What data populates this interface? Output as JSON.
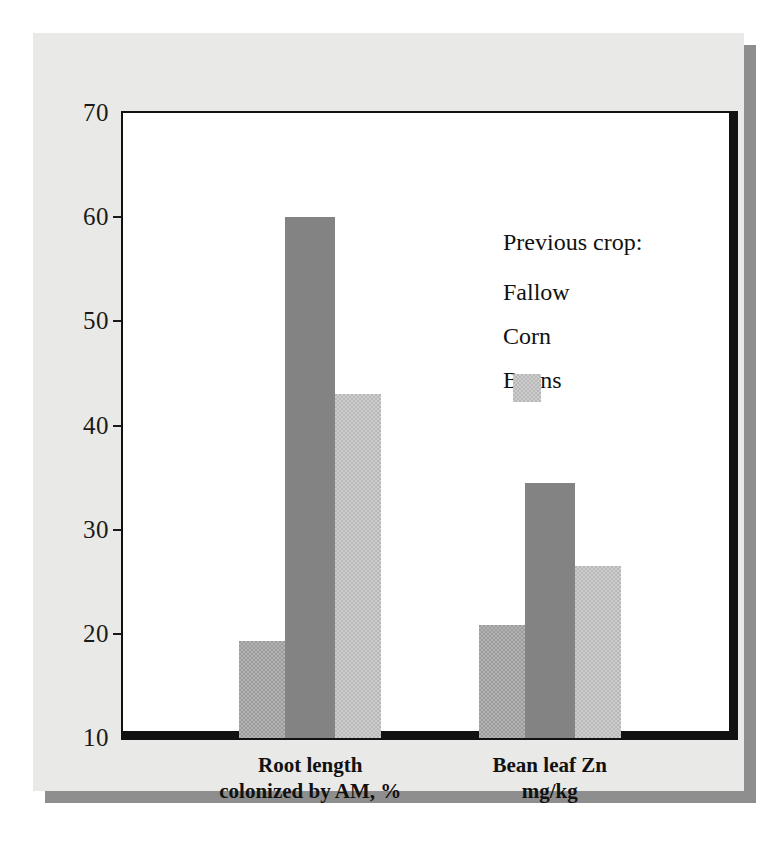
{
  "chart_data": {
    "type": "bar",
    "title": "",
    "xlabel": "",
    "ylabel": "",
    "ylim": [
      10,
      70
    ],
    "yticks": [
      10,
      20,
      30,
      40,
      50,
      60,
      70
    ],
    "ytick_labels": [
      "10",
      "20",
      "30",
      "40",
      "50",
      "60",
      "70"
    ],
    "grid": false,
    "legend_position": "inside-upper-right",
    "legend_title": "Previous crop:",
    "categories": [
      "Root length colonized by AM, %",
      "Bean leaf Zn mg/kg"
    ],
    "category_lines": [
      [
        "Root length",
        "colonized by AM, %"
      ],
      [
        "Bean leaf Zn",
        "mg/kg"
      ]
    ],
    "series": [
      {
        "name": "Fallow",
        "color": "#9c9c9c",
        "values": [
          19.3,
          20.8
        ]
      },
      {
        "name": "Corn",
        "color": "#838383",
        "values": [
          60.0,
          34.5
        ]
      },
      {
        "name": "Beans",
        "color": "#b8b8b8",
        "values": [
          43.0,
          26.5
        ]
      }
    ]
  },
  "legend": {
    "title": "Previous crop:",
    "items": [
      {
        "label": "Fallow"
      },
      {
        "label": "Corn"
      },
      {
        "label": "Beans"
      }
    ]
  },
  "axis": {
    "y_tick_labels": [
      "70",
      "60",
      "50",
      "40",
      "30",
      "20",
      "10"
    ]
  },
  "x_axis": {
    "groups": [
      {
        "line1": "Root length",
        "line2": "colonized by AM, %"
      },
      {
        "line1": "Bean leaf Zn",
        "line2": "mg/kg"
      }
    ]
  },
  "colors": {
    "page_background": "#ffffff",
    "panel_background": "#e9e9e7",
    "panel_shadow": "#8e8e8e",
    "plot_background": "#ffffff",
    "axis_line": "#111111",
    "text": "#111111",
    "fallow": "#9c9c9c",
    "corn": "#838383",
    "beans": "#b8b8b8"
  }
}
